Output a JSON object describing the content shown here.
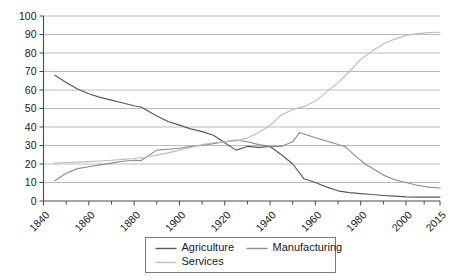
{
  "chart_data": {
    "type": "line",
    "title": "",
    "subtitle": "",
    "xlabel": "",
    "ylabel": "",
    "xlim": [
      1840,
      2015
    ],
    "ylim": [
      0,
      100
    ],
    "grid": true,
    "legend_position": "bottom",
    "y_ticks": [
      0,
      10,
      20,
      30,
      40,
      50,
      60,
      70,
      80,
      90,
      100
    ],
    "y_tick_labels": [
      "0",
      "10",
      "20",
      "30",
      "40",
      "50",
      "60",
      "70",
      "80",
      "90",
      "100"
    ],
    "x_ticks": [
      1840,
      1860,
      1880,
      1900,
      1920,
      1940,
      1960,
      1980,
      2000,
      2015
    ],
    "x_tick_labels": [
      "1840",
      "1860",
      "1880",
      "1900",
      "1920",
      "1940",
      "1960",
      "1980",
      "2000",
      "2015"
    ],
    "x_minor_ticks": [
      1850,
      1870,
      1890,
      1910,
      1930,
      1950,
      1970,
      1990,
      2008
    ],
    "series": [
      {
        "name": "Agriculture",
        "color": "#595959",
        "x": [
          1845,
          1850,
          1855,
          1860,
          1865,
          1870,
          1875,
          1880,
          1883,
          1890,
          1895,
          1900,
          1905,
          1910,
          1915,
          1920,
          1925,
          1930,
          1935,
          1940,
          1945,
          1950,
          1955,
          1960,
          1965,
          1970,
          1975,
          1980,
          1985,
          1990,
          1995,
          2000,
          2005,
          2010,
          2015
        ],
        "values": [
          68,
          64,
          60.5,
          58,
          56,
          54.5,
          53,
          51.5,
          50.8,
          46,
          43,
          41,
          39,
          37.5,
          35.5,
          31.5,
          27.5,
          29.5,
          29,
          29.5,
          25,
          20,
          12,
          10,
          7.5,
          5.5,
          4.5,
          4,
          3.5,
          3,
          2.6,
          2.2,
          2.1,
          2.1,
          2.1
        ]
      },
      {
        "name": "Manufacturing",
        "color": "#8c8c8c",
        "x": [
          1845,
          1850,
          1855,
          1860,
          1865,
          1870,
          1875,
          1880,
          1883,
          1890,
          1895,
          1900,
          1905,
          1910,
          1915,
          1920,
          1925,
          1930,
          1935,
          1940,
          1945,
          1950,
          1953,
          1958,
          1962,
          1966,
          1970,
          1973,
          1978,
          1982,
          1986,
          1990,
          1995,
          2000,
          2005,
          2010,
          2015
        ],
        "values": [
          11,
          15,
          17.5,
          18.5,
          19.5,
          20.5,
          21.5,
          22,
          21.8,
          27.5,
          28,
          28.5,
          29.5,
          30,
          31,
          32,
          33,
          32,
          30.5,
          29.5,
          29.5,
          32,
          37,
          35,
          33.5,
          32,
          30.5,
          29.5,
          24,
          20,
          17,
          14,
          11.5,
          10,
          8.5,
          7.5,
          7
        ]
      },
      {
        "name": "Services",
        "color": "#bdbdbd",
        "x": [
          1845,
          1850,
          1855,
          1860,
          1865,
          1870,
          1875,
          1880,
          1885,
          1890,
          1895,
          1900,
          1905,
          1910,
          1915,
          1920,
          1925,
          1930,
          1935,
          1940,
          1945,
          1950,
          1955,
          1960,
          1965,
          1970,
          1975,
          1980,
          1985,
          1990,
          1995,
          2000,
          2005,
          2010,
          2015
        ],
        "values": [
          20.5,
          20.8,
          21,
          21.3,
          21.6,
          22,
          22.5,
          23,
          23.8,
          24.8,
          26,
          27.5,
          29,
          30.5,
          31.5,
          32,
          32.5,
          34,
          37,
          41,
          46.5,
          49.5,
          51,
          54,
          59,
          64,
          70,
          76.5,
          81,
          85,
          87.5,
          89.5,
          90.5,
          91,
          91.2
        ]
      }
    ]
  },
  "legend": {
    "entries": [
      {
        "label": "Agriculture",
        "color": "#595959"
      },
      {
        "label": "Manufacturing",
        "color": "#8c8c8c"
      },
      {
        "label": "Services",
        "color": "#bdbdbd"
      }
    ]
  }
}
